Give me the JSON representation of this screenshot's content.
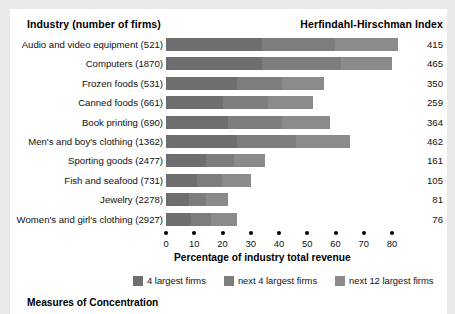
{
  "headers": {
    "industry": "Industry (number of firms)",
    "hhi": "Herfindahl-Hirschman Index"
  },
  "footer": "Measures of Concentration",
  "axis": {
    "title": "Percentage of industry total revenue",
    "ticks": [
      "0",
      "10",
      "20",
      "30",
      "40",
      "50",
      "60",
      "70",
      "80"
    ]
  },
  "legend": [
    {
      "label": "4 largest firms",
      "color": "#6e6e6e"
    },
    {
      "label": "next 4 largest firms",
      "color": "#7d7d7d"
    },
    {
      "label": "next 12 largest firms",
      "color": "#8b8b8b"
    }
  ],
  "chart_data": {
    "type": "bar",
    "orientation": "horizontal",
    "stacked": true,
    "title": "Measures of Concentration",
    "xlabel": "Percentage of industry total revenue",
    "ylabel": "Industry (number of firms)",
    "xlim": [
      0,
      80
    ],
    "xticks": [
      0,
      10,
      20,
      30,
      40,
      50,
      60,
      70,
      80
    ],
    "grid": false,
    "legend_position": "bottom",
    "categories": [
      "Audio and video equipment  (521)",
      "Computers  (1870)",
      "Frozen foods  (531)",
      "Canned foods  (661)",
      "Book printing  (690)",
      "Men's and boy's clothing  (1362)",
      "Sporting goods  (2477)",
      "Fish and seafood  (731)",
      "Jewelry  (2278)",
      "Women's and girl's clothing  (2927)"
    ],
    "series": [
      {
        "name": "4 largest firms",
        "color": "#6e6e6e",
        "values": [
          34,
          34,
          25,
          20,
          22,
          25,
          14,
          11,
          8,
          9
        ]
      },
      {
        "name": "next 4 largest firms",
        "color": "#7d7d7d",
        "values": [
          26,
          28,
          16,
          16,
          19,
          21,
          10,
          9,
          6,
          7
        ]
      },
      {
        "name": "next 12 largest firms",
        "color": "#8b8b8b",
        "values": [
          22,
          18,
          15,
          16,
          17,
          19,
          11,
          10,
          8,
          9
        ]
      }
    ],
    "right_axis": {
      "label": "Herfindahl-Hirschman Index",
      "values": [
        415,
        465,
        350,
        259,
        364,
        462,
        161,
        105,
        81,
        76
      ]
    }
  }
}
